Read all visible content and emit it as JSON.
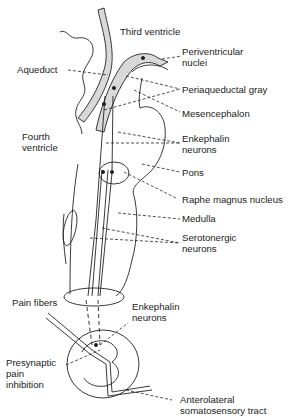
{
  "figure": {
    "colors": {
      "stroke": "#222222",
      "gray_fill": "#d9d9d9",
      "text": "#222222",
      "background": "#ffffff"
    }
  },
  "labels": {
    "third_ventricle": "Third ventricle",
    "periventricular_1": "Periventricular",
    "periventricular_2": "nuclei",
    "aqueduct": "Aqueduct",
    "periaqueductal_gray": "Periaqueductal gray",
    "mesencephalon": "Mesencephalon",
    "fourth_ventricle_1": "Fourth",
    "fourth_ventricle_2": "ventricle",
    "enkephalin_upper_1": "Enkephalin",
    "enkephalin_upper_2": "neurons",
    "pons": "Pons",
    "raphe_magnus": "Raphe magnus nucleus",
    "medulla": "Medulla",
    "serotonergic_1": "Serotonergic",
    "serotonergic_2": "neurons",
    "pain_fibers": "Pain fibers",
    "enkephalin_lower_1": "Enkephalin",
    "enkephalin_lower_2": "neurons",
    "presynaptic_1": "Presynaptic",
    "presynaptic_2": "pain",
    "presynaptic_3": "inhibition",
    "anterolateral_1": "Anterolateral",
    "anterolateral_2": "somatosensory tract"
  }
}
